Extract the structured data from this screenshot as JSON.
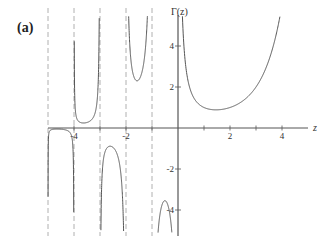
{
  "panel_label": "(a)",
  "chart_data": {
    "type": "line",
    "title": "",
    "function": "Gamma function Γ(z) on the real axis",
    "xlabel": "z",
    "ylabel": "Γ(z)",
    "xlim": [
      -5.0,
      4.0
    ],
    "ylim": [
      -5.0,
      5.0
    ],
    "x_ticks": [
      -4,
      -2,
      2,
      4
    ],
    "x_ticks_minor": [
      -3,
      -1,
      1,
      3
    ],
    "y_ticks": [
      -4,
      -2,
      2,
      4
    ],
    "grid": false,
    "legend": null,
    "asymptotes": {
      "style": "dashed",
      "color": "#aaaaaa",
      "x": [
        -5,
        -4,
        -3,
        -2,
        -1
      ]
    },
    "series": [
      {
        "name": "Γ(z)",
        "color": "#555555",
        "branches": [
          {
            "interval": [
              -5,
              -4
            ],
            "shape": "negative dome",
            "extremum": {
              "x": -4.57,
              "y": -0.0
            }
          },
          {
            "interval": [
              -4,
              -3
            ],
            "shape": "U",
            "extremum": {
              "x": -3.64,
              "y": 0.25
            }
          },
          {
            "interval": [
              -3,
              -2
            ],
            "shape": "inverted U",
            "extremum": {
              "x": -2.61,
              "y": -0.89
            }
          },
          {
            "interval": [
              -2,
              -1
            ],
            "shape": "U",
            "extremum": {
              "x": -1.5,
              "y": 2.36
            }
          },
          {
            "interval": [
              -1,
              0
            ],
            "shape": "inverted U (partial)",
            "extremum": {
              "x": -0.5,
              "y": -3.54
            }
          },
          {
            "interval": [
              0,
              4
            ],
            "shape": "U",
            "extremum": {
              "x": 1.46,
              "y": 0.89
            }
          }
        ],
        "sample_points": [
          {
            "x": 0.2,
            "y": 4.59
          },
          {
            "x": 0.5,
            "y": 1.77
          },
          {
            "x": 1.0,
            "y": 1.0
          },
          {
            "x": 1.46,
            "y": 0.89
          },
          {
            "x": 2.0,
            "y": 1.0
          },
          {
            "x": 3.0,
            "y": 2.0
          },
          {
            "x": 3.5,
            "y": 3.32
          },
          {
            "x": 3.8,
            "y": 4.69
          },
          {
            "x": -1.5,
            "y": 2.36
          },
          {
            "x": -0.5,
            "y": -3.54
          },
          {
            "x": -2.5,
            "y": -0.95
          }
        ]
      }
    ]
  },
  "axes": {
    "x_tick_labels": [
      "-4",
      "-2",
      "2",
      "4"
    ],
    "y_tick_labels": [
      "4",
      "2",
      "-2",
      "-4"
    ],
    "x_axis_label": "z",
    "y_axis_label": "Γ(z)"
  },
  "colors": {
    "curve": "#555555",
    "axis": "#555555",
    "asymptote": "#b0b0b0",
    "text": "#333333"
  }
}
